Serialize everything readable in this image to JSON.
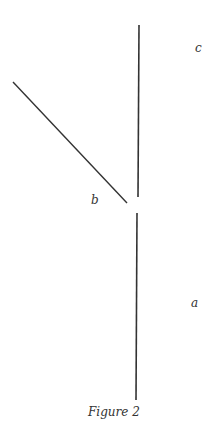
{
  "figure": {
    "caption": "Figure 2",
    "labels": {
      "a": "a",
      "b": "b",
      "c": "c"
    },
    "line_color": "#333333"
  }
}
